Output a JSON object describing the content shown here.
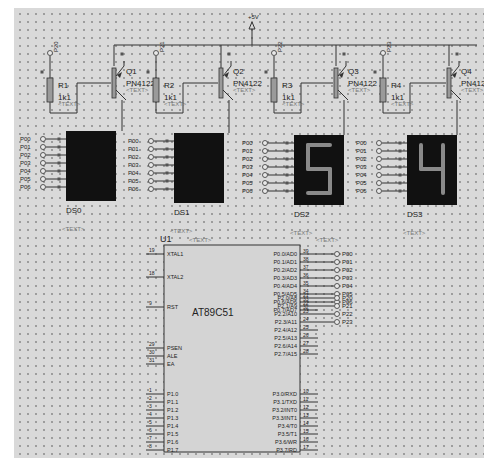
{
  "supply": {
    "label": "+5V"
  },
  "transistors": [
    {
      "ref": "Q1",
      "part": "PN4122",
      "text": "<TEXT>"
    },
    {
      "ref": "Q2",
      "part": "PN4122",
      "text": "<TEXT>"
    },
    {
      "ref": "Q3",
      "part": "PN4122",
      "text": "<TEXT>"
    },
    {
      "ref": "Q4",
      "part": "PN4122",
      "text": "<TEXT>"
    }
  ],
  "resistors": [
    {
      "ref": "R1",
      "value": "1k1",
      "text": "<TEXT>"
    },
    {
      "ref": "R2",
      "value": "1k1",
      "text": "<TEXT>"
    },
    {
      "ref": "R3",
      "value": "1k1",
      "text": "<TEXT>"
    },
    {
      "ref": "R4",
      "value": "1k1",
      "text": "<TEXT>"
    }
  ],
  "base_terminals": [
    "P20",
    "P21",
    "P22",
    "P23"
  ],
  "displays": [
    {
      "ref": "DS0",
      "digit": "",
      "text": "<TEXT>"
    },
    {
      "ref": "DS1",
      "digit": "",
      "text": "<TEXT>"
    },
    {
      "ref": "DS2",
      "digit": "5",
      "text": "<TEXT>"
    },
    {
      "ref": "DS3",
      "digit": "4",
      "text": "<TEXT>"
    }
  ],
  "segment_labels": [
    "P00",
    "P01",
    "P02",
    "P03",
    "P04",
    "P05",
    "P06"
  ],
  "mcu": {
    "ref": "U1",
    "part": "AT89C51",
    "text": "<TEXT>",
    "left_pins": [
      {
        "num": "19",
        "name": "XTAL1"
      },
      {
        "num": "18",
        "name": "XTAL2"
      },
      {
        "num": "9",
        "name": "RST"
      },
      {
        "num": "29",
        "name": "PSEN"
      },
      {
        "num": "30",
        "name": "ALE"
      },
      {
        "num": "31",
        "name": "EA"
      },
      {
        "num": "1",
        "name": "P1.0"
      },
      {
        "num": "2",
        "name": "P1.1"
      },
      {
        "num": "3",
        "name": "P1.2"
      },
      {
        "num": "4",
        "name": "P1.3"
      },
      {
        "num": "5",
        "name": "P1.4"
      },
      {
        "num": "6",
        "name": "P1.5"
      },
      {
        "num": "7",
        "name": "P1.6"
      },
      {
        "num": "8",
        "name": "P1.7"
      }
    ],
    "right_pins": [
      {
        "num": "39",
        "name": "P0.0/AD0"
      },
      {
        "num": "38",
        "name": "P0.1/AD1"
      },
      {
        "num": "37",
        "name": "P0.2/AD2"
      },
      {
        "num": "36",
        "name": "P0.3/AD3"
      },
      {
        "num": "35",
        "name": "P0.4/AD4"
      },
      {
        "num": "34",
        "name": "P0.5/AD5"
      },
      {
        "num": "33",
        "name": "P0.6/AD6"
      },
      {
        "num": "32",
        "name": "P0.7/AD7"
      },
      {
        "num": "21",
        "name": "P2.0/A8"
      },
      {
        "num": "22",
        "name": "P2.1/A9"
      },
      {
        "num": "23",
        "name": "P2.2/A10"
      },
      {
        "num": "24",
        "name": "P2.3/A11"
      },
      {
        "num": "25",
        "name": "P2.4/A12"
      },
      {
        "num": "26",
        "name": "P2.5/A13"
      },
      {
        "num": "27",
        "name": "P2.6/A14"
      },
      {
        "num": "28",
        "name": "P2.7/A15"
      },
      {
        "num": "10",
        "name": "P3.0/RXD"
      },
      {
        "num": "11",
        "name": "P3.1/TXD"
      },
      {
        "num": "12",
        "name": "P3.2/INT0"
      },
      {
        "num": "13",
        "name": "P3.3/INT1"
      },
      {
        "num": "14",
        "name": "P3.4/T0"
      },
      {
        "num": "15",
        "name": "P3.5/T1"
      },
      {
        "num": "16",
        "name": "P3.6/WR"
      },
      {
        "num": "17",
        "name": "P3.7/RD"
      }
    ],
    "p0_terminals": [
      "P00",
      "P01",
      "P02",
      "P03",
      "P04",
      "P05",
      "P06"
    ],
    "p2_terminals": [
      "P20",
      "P21",
      "P22",
      "P23"
    ]
  },
  "colors": {
    "sheet": "#d9d9d9",
    "wire": "#333333",
    "display_bg": "#111111",
    "segment_on": "#8a8a8a",
    "resistor": "#9a9a9a"
  }
}
